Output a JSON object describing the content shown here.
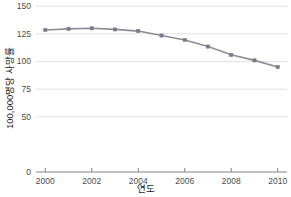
{
  "chart_data": {
    "type": "line",
    "title": "",
    "subtitle": "",
    "xlabel": "연도",
    "ylabel": "100,000명당 사망률",
    "x": [
      2000,
      2001,
      2002,
      2003,
      2004,
      2005,
      2006,
      2007,
      2008,
      2009,
      2010
    ],
    "values": [
      128.5,
      129.5,
      130.0,
      129.0,
      127.5,
      123.5,
      119.5,
      113.5,
      106.0,
      101.0,
      95.0
    ],
    "series": [
      {
        "name": "100,000명당 사망률",
        "values": [
          128.5,
          129.5,
          130.0,
          129.0,
          127.5,
          123.5,
          119.5,
          113.5,
          106.0,
          101.0,
          95.0
        ]
      }
    ],
    "xlim": [
      1999.6,
      2010.4
    ],
    "ylim": [
      0,
      152
    ],
    "xticks": [
      2000,
      2002,
      2004,
      2006,
      2008,
      2010
    ],
    "xtick_labels": [
      "2000",
      "2002",
      "2004",
      "2006",
      "2008",
      "2010"
    ],
    "yticks": [
      0,
      50,
      75,
      100,
      125,
      150
    ],
    "ytick_labels": [
      "0",
      "50",
      "75",
      "100",
      "125",
      "150"
    ],
    "grid": true,
    "grid_axis": "y",
    "legend": false,
    "legend_position": "none",
    "marker": "square",
    "colors": {
      "line": "#8c8c99",
      "marker": "#7a7a88",
      "grid": "#d9d9d9",
      "axis": "#808080",
      "text": "#1a1a1a",
      "tick_text": "#4d4d4d",
      "background": "#ffffff"
    }
  }
}
